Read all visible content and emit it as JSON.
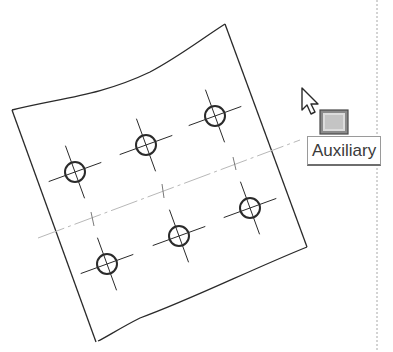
{
  "viewport": {
    "width": 393,
    "height": 352
  },
  "colors": {
    "geometry": "#2a2a2a",
    "centerline": "#b8b8b8",
    "divider": "#a8a8a8",
    "tooltip_border": "#9a9a9a"
  },
  "plate": {
    "corners": {
      "top_left": [
        12,
        110
      ],
      "top_right": [
        225,
        24
      ],
      "bottom_right": [
        307,
        247
      ],
      "bottom_left": [
        95,
        342
      ]
    },
    "top_edge": "wavy"
  },
  "holes": [
    {
      "cx": 75,
      "cy": 172
    },
    {
      "cx": 146,
      "cy": 145
    },
    {
      "cx": 215,
      "cy": 116
    },
    {
      "cx": 107,
      "cy": 264
    },
    {
      "cx": 179,
      "cy": 236
    },
    {
      "cx": 250,
      "cy": 208
    }
  ],
  "centerline": {
    "from": [
      38,
      238
    ],
    "to": [
      300,
      140
    ]
  },
  "cursor": {
    "icon": "arrow-pointer-icon",
    "x": 302,
    "y": 88
  },
  "command_icon": {
    "icon": "auxiliary-view-icon",
    "x": 320,
    "y": 110,
    "w": 28,
    "h": 24
  },
  "tooltip": {
    "label": "Auxiliary"
  },
  "divider_x": 377
}
